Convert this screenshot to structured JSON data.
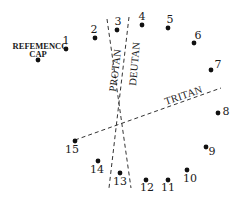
{
  "diagram": {
    "type": "color-vision-cap-arrangement",
    "reference_cap": {
      "label_line1": "REFEMENCC",
      "label_line2": "CAP",
      "x": 38,
      "y": 60
    },
    "caps": [
      {
        "label": "1",
        "x": 66,
        "y": 49,
        "lx": 66,
        "ly": 44
      },
      {
        "label": "2",
        "x": 95,
        "y": 38,
        "lx": 94,
        "ly": 33
      },
      {
        "label": "3",
        "x": 117,
        "y": 30,
        "lx": 118,
        "ly": 25
      },
      {
        "label": "4",
        "x": 142,
        "y": 25,
        "lx": 142,
        "ly": 20
      },
      {
        "label": "5",
        "x": 168,
        "y": 28,
        "lx": 170,
        "ly": 23
      },
      {
        "label": "6",
        "x": 194,
        "y": 43,
        "lx": 198,
        "ly": 39
      },
      {
        "label": "7",
        "x": 211,
        "y": 70,
        "lx": 218,
        "ly": 68
      },
      {
        "label": "8",
        "x": 218,
        "y": 113,
        "lx": 226,
        "ly": 115
      },
      {
        "label": "9",
        "x": 206,
        "y": 147,
        "lx": 212,
        "ly": 155
      },
      {
        "label": "10",
        "x": 187,
        "y": 170,
        "lx": 190,
        "ly": 182
      },
      {
        "label": "11",
        "x": 168,
        "y": 180,
        "lx": 168,
        "ly": 191
      },
      {
        "label": "12",
        "x": 146,
        "y": 180,
        "lx": 147,
        "ly": 191
      },
      {
        "label": "13",
        "x": 120,
        "y": 173,
        "lx": 120,
        "ly": 185
      },
      {
        "label": "14",
        "x": 98,
        "y": 161,
        "lx": 97,
        "ly": 173
      },
      {
        "label": "15",
        "x": 75,
        "y": 141,
        "lx": 72,
        "ly": 153
      }
    ],
    "axes": [
      {
        "name": "PROTAN",
        "x1": 107,
        "y1": 19,
        "x2": 131,
        "y2": 188
      },
      {
        "name": "DEUTAN",
        "x1": 129,
        "y1": 17,
        "x2": 109,
        "y2": 188
      },
      {
        "name": "TRITAN",
        "x1": 75,
        "y1": 140,
        "x2": 221,
        "y2": 88
      }
    ],
    "axis_labels": {
      "protan": "PROTAN",
      "deutan": "DEUTAN",
      "tritan": "TRITAN"
    }
  }
}
